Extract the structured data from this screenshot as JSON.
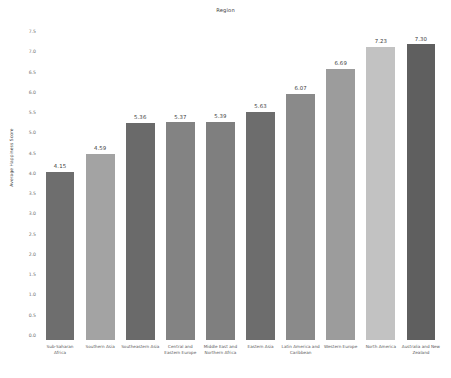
{
  "chart_data": {
    "type": "bar",
    "title": "Region",
    "xlabel": "",
    "ylabel": "Average Happiness Score",
    "ylim": [
      0.0,
      7.5
    ],
    "grid": false,
    "legend": null,
    "yticks": [
      "0.0",
      "0.5",
      "1.0",
      "1.5",
      "2.0",
      "2.5",
      "3.0",
      "3.5",
      "4.0",
      "4.5",
      "5.0",
      "5.5",
      "6.0",
      "6.5",
      "7.0",
      "7.5"
    ],
    "ytick_values": [
      0.0,
      0.5,
      1.0,
      1.5,
      2.0,
      2.5,
      3.0,
      3.5,
      4.0,
      4.5,
      5.0,
      5.5,
      6.0,
      6.5,
      7.0,
      7.5
    ],
    "categories": [
      "Sub-Saharan Africa",
      "Southern Asia",
      "Southeastern Asia",
      "Central and Eastern Europe",
      "Middle East and Northern Africa",
      "Eastern Asia",
      "Latin America and Caribbean",
      "Western Europe",
      "North America",
      "Australia and New Zealand"
    ],
    "values": [
      4.15,
      4.59,
      5.36,
      5.37,
      5.39,
      5.63,
      6.07,
      6.69,
      7.23,
      7.3
    ],
    "value_labels": [
      "4.15",
      "4.59",
      "5.36",
      "5.37",
      "5.39",
      "5.63",
      "6.07",
      "6.69",
      "7.23",
      "7.30"
    ],
    "bar_colors": [
      "#6e6e6e",
      "#a3a3a3",
      "#6a6a6a",
      "#838383",
      "#7f7f7f",
      "#6d6d6d",
      "#8a8a8a",
      "#9c9c9c",
      "#c2c2c2",
      "#5f5f5f"
    ]
  }
}
